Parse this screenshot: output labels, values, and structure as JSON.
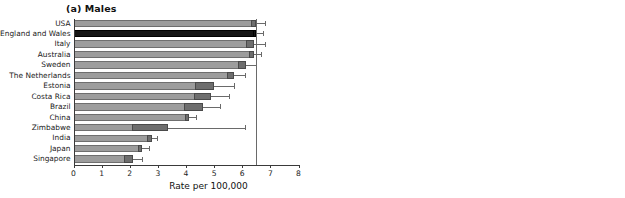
{
  "figure": {
    "panels": [
      {
        "id": "males",
        "title": "(a) Males",
        "xlabel": "Rate per 100,000",
        "reference_line": 6.5
      },
      {
        "id": "females",
        "title": "(b) Females",
        "xlabel": "Rate per 100,000",
        "reference_line": 4.55
      }
    ],
    "axis": {
      "min": 0,
      "max": 8,
      "ticks": [
        0,
        1,
        2,
        3,
        4,
        5,
        6,
        7,
        8
      ],
      "tick_labels": [
        "0",
        "1",
        "2",
        "3",
        "4",
        "5",
        "6",
        "7",
        "8"
      ]
    },
    "colors": {
      "bar": "#9d9d9d",
      "bar_highlight": "#151515",
      "ci_box": "#6e6e6e",
      "whisker": "#6a6a6a",
      "axis": "#3a3a3a",
      "reference_line": "#6a6a6a",
      "text": "#1a1a1a"
    }
  },
  "chart_data": {
    "type": "bar",
    "xlabel": "Rate per 100,000",
    "ylabel": "",
    "xlim": [
      0,
      8
    ],
    "grid": false,
    "legend": "none",
    "orientation": "horizontal",
    "categories": [
      "USA",
      "England and  Wales",
      "Italy",
      "Australia",
      "Sweden",
      "The Netherlands",
      "Estonia",
      "Costa Rica",
      "Brazil",
      "China",
      "Zimbabwe",
      "India",
      "Japan",
      "Singapore"
    ],
    "panels": [
      {
        "name": "(a) Males",
        "reference_line": 6.5,
        "values": [
          6.5,
          6.5,
          6.42,
          6.4,
          6.15,
          5.72,
          5.0,
          4.9,
          4.6,
          4.12,
          3.35,
          2.78,
          2.42,
          2.1
        ],
        "ci_lower": [
          6.3,
          6.38,
          6.12,
          6.25,
          5.85,
          5.45,
          4.32,
          4.3,
          3.92,
          3.95,
          2.08,
          2.62,
          2.3,
          1.78
        ],
        "ci_upper": [
          6.8,
          6.72,
          6.8,
          6.68,
          6.5,
          6.08,
          5.72,
          5.52,
          5.2,
          4.35,
          6.1,
          2.98,
          2.68,
          2.45
        ],
        "highlight_index": 1
      },
      {
        "name": "(b) Females",
        "reference_line": 4.55,
        "values": [
          4.55,
          4.55,
          4.62,
          4.72,
          5.05,
          3.78,
          4.08,
          3.62,
          2.62,
          3.2,
          3.22,
          1.62,
          1.82,
          1.58
        ],
        "ci_lower": [
          4.42,
          4.45,
          4.35,
          4.55,
          4.72,
          3.6,
          3.45,
          3.12,
          2.22,
          3.02,
          1.62,
          1.48,
          1.68,
          1.28
        ],
        "ci_upper": [
          4.78,
          4.78,
          4.88,
          4.92,
          5.38,
          4.05,
          4.7,
          4.12,
          3.05,
          3.45,
          4.72,
          1.82,
          2.05,
          1.85
        ],
        "highlight_index": 1
      }
    ]
  }
}
